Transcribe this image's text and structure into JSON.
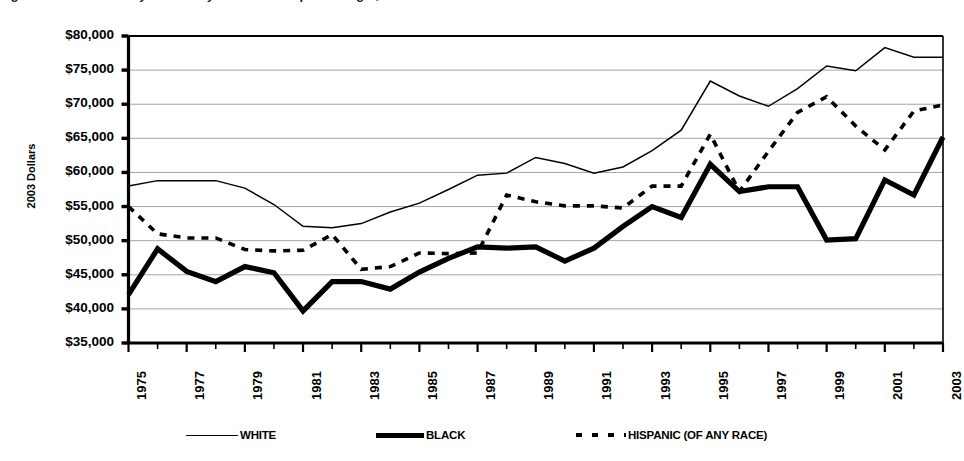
{
  "figure": {
    "clipped_caption": "Figure 6. Median Family Income by Race and Hispanic Origin, 1975-2003",
    "ylabel": "2003 Dollars"
  },
  "axes": {
    "y_tick_labels": [
      "$80,000",
      "$75,000",
      "$70,000",
      "$65,000",
      "$60,000",
      "$55,000",
      "$50,000",
      "$45,000",
      "$40,000",
      "$35,000"
    ],
    "x_tick_labels": [
      "1975",
      "1977",
      "1979",
      "1981",
      "1983",
      "1985",
      "1987",
      "1989",
      "1991",
      "1993",
      "1995",
      "1997",
      "1999",
      "2001",
      "2003"
    ]
  },
  "legend": {
    "entries": [
      {
        "label": "WHITE",
        "style": "thin-solid",
        "swatch": "line-thin-icon"
      },
      {
        "label": "BLACK",
        "style": "thick-solid",
        "swatch": "line-thick-icon"
      },
      {
        "label": "HISPANIC (OF ANY RACE)",
        "style": "dashed",
        "swatch": "line-dashed-icon"
      }
    ]
  },
  "chart_data": {
    "type": "line",
    "title": "Median Family Income by Race and Hispanic Origin, 1975-2003",
    "xlabel": "",
    "ylabel": "2003 Dollars",
    "xlim": [
      1975,
      2003
    ],
    "ylim": [
      35000,
      80000
    ],
    "y_tick_step": 5000,
    "grid": true,
    "legend_position": "bottom",
    "x": [
      1975,
      1976,
      1977,
      1978,
      1979,
      1980,
      1981,
      1982,
      1983,
      1984,
      1985,
      1986,
      1987,
      1988,
      1989,
      1990,
      1991,
      1992,
      1993,
      1994,
      1995,
      1996,
      1997,
      1998,
      1999,
      2000,
      2001,
      2002,
      2003
    ],
    "series": [
      {
        "name": "WHITE",
        "style": "thin-solid",
        "values": [
          58000,
          58800,
          58800,
          58800,
          57700,
          55300,
          52100,
          51900,
          52500,
          54200,
          55500,
          57500,
          59600,
          59900,
          62200,
          61300,
          59900,
          60800,
          63200,
          66200,
          73400,
          71200,
          69700,
          72300,
          75600,
          74900,
          78300,
          76900,
          76900
        ]
      },
      {
        "name": "BLACK",
        "style": "thick-solid",
        "values": [
          42100,
          48800,
          45500,
          44000,
          46200,
          45300,
          39700,
          44000,
          44000,
          42900,
          45400,
          47400,
          49100,
          48900,
          49100,
          47000,
          48900,
          52100,
          55000,
          53400,
          61200,
          57200,
          57900,
          57900,
          50100,
          50300,
          58900,
          56700,
          65200
        ]
      },
      {
        "name": "HISPANIC (OF ANY RACE)",
        "style": "dashed",
        "values": [
          55000,
          51000,
          50400,
          50400,
          48700,
          48500,
          48600,
          50900,
          45800,
          46200,
          48200,
          48100,
          48200,
          56700,
          55700,
          55100,
          55100,
          54800,
          58000,
          58000,
          65600,
          57200,
          63100,
          68800,
          71100,
          66800,
          63300,
          69000,
          69900
        ]
      }
    ]
  }
}
